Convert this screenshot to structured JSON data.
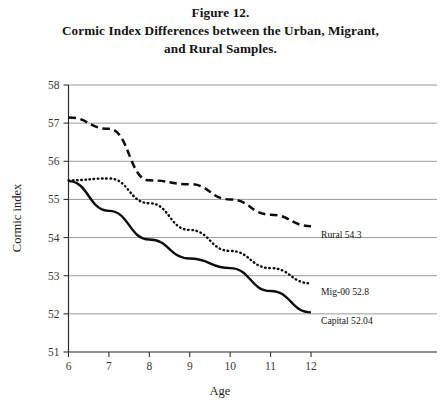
{
  "figure": {
    "title_lines": [
      "Figure 12.",
      "Cormic Index Differences between the Urban, Migrant,",
      "and Rural Samples."
    ]
  },
  "chart_data": {
    "type": "line",
    "title": "Cormic Index Differences between the Urban, Migrant, and Rural Samples.",
    "subtitle": "Figure 12.",
    "xlabel": "Age",
    "ylabel": "Cormic index",
    "x": [
      6,
      7,
      8,
      9,
      10,
      11,
      12
    ],
    "categories": [
      "6",
      "7",
      "8",
      "9",
      "10",
      "11",
      "12"
    ],
    "xlim": [
      6,
      12
    ],
    "ylim": [
      51,
      58
    ],
    "yticks": [
      51,
      52,
      53,
      54,
      55,
      56,
      57,
      58
    ],
    "ytick_labels": [
      "51",
      "52",
      "53",
      "54",
      "55",
      "56",
      "57",
      "58"
    ],
    "xtick_labels": [
      "6",
      "7",
      "8",
      "9",
      "10",
      "11",
      "12"
    ],
    "grid": true,
    "grid_axis": "y",
    "legend": "inline-end-labels",
    "series": [
      {
        "name": "Rural",
        "style": "dashed",
        "end_label": "Rural 54.3",
        "end_value": 54.3,
        "values": [
          57.15,
          56.85,
          55.5,
          55.4,
          55.0,
          54.6,
          54.3
        ]
      },
      {
        "name": "Mig-00",
        "style": "dotted",
        "end_label": "Mig-00 52.8",
        "end_value": 52.8,
        "values": [
          55.5,
          55.55,
          54.9,
          54.2,
          53.65,
          53.2,
          52.8
        ]
      },
      {
        "name": "Capital",
        "style": "solid",
        "end_label": "Capital 52.04",
        "end_value": 52.04,
        "values": [
          55.48,
          54.7,
          53.95,
          53.45,
          53.2,
          52.6,
          52.04
        ]
      }
    ],
    "annotations": [
      {
        "text": "Rural 54.3",
        "series": "Rural"
      },
      {
        "text": "Mig-00 52.8",
        "series": "Mig-00"
      },
      {
        "text": "Capital 52.04",
        "series": "Capital"
      }
    ],
    "colors": {
      "line": "#0d0d0d",
      "grid": "#6e6e6e",
      "axis": "#2a2a2a",
      "text": "#1a1a1a",
      "background": "#ffffff"
    }
  }
}
